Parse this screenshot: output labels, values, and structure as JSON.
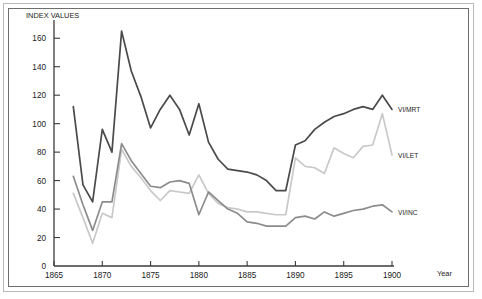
{
  "chart_data": {
    "type": "line",
    "title": "",
    "ylabel": "INDEX VALUES",
    "xlabel": "Year",
    "xlim": [
      1865,
      1900
    ],
    "ylim": [
      0,
      170
    ],
    "yticks": [
      0,
      20,
      40,
      60,
      80,
      100,
      120,
      140,
      160
    ],
    "xticks": [
      1865,
      1870,
      1875,
      1880,
      1885,
      1890,
      1895,
      1900
    ],
    "grid": false,
    "legend_position": "right-inline",
    "x": [
      1867,
      1868,
      1869,
      1870,
      1871,
      1872,
      1873,
      1874,
      1875,
      1876,
      1877,
      1878,
      1879,
      1880,
      1881,
      1882,
      1883,
      1884,
      1885,
      1886,
      1887,
      1888,
      1889,
      1890,
      1891,
      1892,
      1893,
      1894,
      1895,
      1896,
      1897,
      1898,
      1899,
      1900
    ],
    "series": [
      {
        "name": "VI/MRT",
        "label": "VI/MRT",
        "color": "#4a4a4a",
        "values": [
          112,
          57,
          45,
          96,
          80,
          165,
          137,
          119,
          97,
          110,
          120,
          110,
          92,
          114,
          87,
          75,
          68,
          67,
          66,
          64,
          60,
          53,
          53,
          85,
          88,
          96,
          101,
          105,
          107,
          110,
          112,
          110,
          120,
          110
        ]
      },
      {
        "name": "VI/LET",
        "label": "VI/LET",
        "color": "#c9c9c9",
        "values": [
          51,
          34,
          16,
          37,
          34,
          82,
          70,
          62,
          53,
          46,
          53,
          52,
          51,
          64,
          51,
          44,
          41,
          40,
          38,
          38,
          37,
          36,
          36,
          76,
          70,
          69,
          65,
          83,
          79,
          76,
          84,
          85,
          107,
          78
        ]
      },
      {
        "name": "VI/INC",
        "label": "VI/INC",
        "color": "#8c8c8c",
        "values": [
          63,
          43,
          25,
          45,
          45,
          86,
          74,
          65,
          56,
          55,
          59,
          60,
          58,
          36,
          52,
          46,
          40,
          37,
          31,
          30,
          28,
          28,
          28,
          34,
          35,
          33,
          38,
          35,
          37,
          39,
          40,
          42,
          43,
          38
        ]
      }
    ]
  },
  "axis": {
    "y_title": "INDEX VALUES",
    "x_title": "Year",
    "ytick_labels": [
      "0",
      "20",
      "40",
      "60",
      "80",
      "100",
      "120",
      "140",
      "160"
    ],
    "xtick_labels": [
      "1865",
      "1870",
      "1875",
      "1880",
      "1885",
      "1890",
      "1895",
      "1900"
    ]
  },
  "series_labels": {
    "top": "VI/MRT",
    "middle": "VI/LET",
    "bottom": "VI/INC"
  }
}
